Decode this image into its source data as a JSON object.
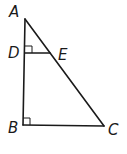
{
  "diagram": {
    "type": "geometry-triangle",
    "points": {
      "A": {
        "label": "A",
        "x": 25,
        "y": 19
      },
      "D": {
        "label": "D",
        "x": 25,
        "y": 53
      },
      "E": {
        "label": "E",
        "x": 50,
        "y": 53
      },
      "B": {
        "label": "B",
        "x": 23,
        "y": 125
      },
      "C": {
        "label": "C",
        "x": 104,
        "y": 126
      }
    },
    "segments": [
      "AB",
      "BC",
      "CA",
      "DE"
    ],
    "right_angles": [
      "ADE",
      "ABC"
    ],
    "colors": {
      "stroke": "#1a1a1a",
      "background": "#ffffff"
    }
  }
}
